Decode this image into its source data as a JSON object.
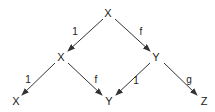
{
  "diagram": {
    "type": "commutative-diagram",
    "colors": {
      "background": "#ffffff",
      "ink": "#222222",
      "edge": "#333333"
    },
    "nodes": [
      {
        "id": "n0",
        "label": "X",
        "x": 108,
        "y": 13
      },
      {
        "id": "n1",
        "label": "X",
        "x": 61,
        "y": 57
      },
      {
        "id": "n2",
        "label": "Y",
        "x": 156,
        "y": 57
      },
      {
        "id": "n3",
        "label": "X",
        "x": 16,
        "y": 101
      },
      {
        "id": "n4",
        "label": "Y",
        "x": 109,
        "y": 101
      },
      {
        "id": "n5",
        "label": "Z",
        "x": 204,
        "y": 101
      }
    ],
    "edges": [
      {
        "from": "n0",
        "to": "n1",
        "label": "1",
        "x1": 103,
        "y1": 19,
        "x2": 68,
        "y2": 51,
        "lx": 75,
        "ly": 35
      },
      {
        "from": "n0",
        "to": "n2",
        "label": "f",
        "x1": 115,
        "y1": 19,
        "x2": 150,
        "y2": 51,
        "lx": 141,
        "ly": 35
      },
      {
        "from": "n1",
        "to": "n3",
        "label": "1",
        "x1": 55,
        "y1": 63,
        "x2": 22,
        "y2": 95,
        "lx": 28,
        "ly": 83
      },
      {
        "from": "n1",
        "to": "n4",
        "label": "f",
        "x1": 68,
        "y1": 63,
        "x2": 102,
        "y2": 95,
        "lx": 96,
        "ly": 83
      },
      {
        "from": "n2",
        "to": "n4",
        "label": "1",
        "x1": 150,
        "y1": 63,
        "x2": 116,
        "y2": 95,
        "lx": 136,
        "ly": 84
      },
      {
        "from": "n2",
        "to": "n5",
        "label": "g",
        "x1": 164,
        "y1": 63,
        "x2": 197,
        "y2": 95,
        "lx": 189,
        "ly": 83
      }
    ]
  }
}
